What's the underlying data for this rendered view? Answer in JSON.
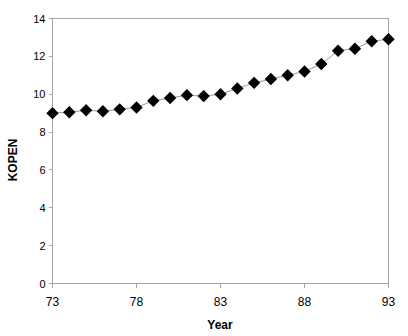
{
  "chart_data": {
    "type": "line",
    "title": "",
    "xlabel": "Year",
    "ylabel": "KOPEN",
    "x": [
      73,
      74,
      75,
      76,
      77,
      78,
      79,
      80,
      81,
      82,
      83,
      84,
      85,
      86,
      87,
      88,
      89,
      90,
      91,
      92,
      93
    ],
    "values": [
      9.0,
      9.05,
      9.15,
      9.1,
      9.2,
      9.3,
      9.65,
      9.8,
      9.95,
      9.9,
      10.0,
      10.3,
      10.6,
      10.8,
      11.0,
      11.2,
      11.6,
      12.3,
      12.4,
      12.8,
      12.9
    ],
    "series": [
      {
        "name": "KOPEN",
        "values": [
          9.0,
          9.05,
          9.15,
          9.1,
          9.2,
          9.3,
          9.65,
          9.8,
          9.95,
          9.9,
          10.0,
          10.3,
          10.6,
          10.8,
          11.0,
          11.2,
          11.6,
          12.3,
          12.4,
          12.8,
          12.9
        ]
      }
    ],
    "xlim": [
      73,
      93
    ],
    "ylim": [
      0,
      14
    ],
    "ytick_values": [
      0,
      2,
      4,
      6,
      8,
      10,
      12,
      14
    ],
    "ytick_labels": [
      "0",
      "2",
      "4",
      "6",
      "8",
      "10",
      "12",
      "14"
    ],
    "xtick_values": [
      73,
      78,
      83,
      88,
      93
    ],
    "xtick_labels": [
      "73",
      "78",
      "83",
      "88",
      "93"
    ],
    "grid": false,
    "legend": false,
    "marker": "diamond",
    "marker_color": "#000000",
    "line_color": "#9a9a9a",
    "axis_color": "#a6a6a6",
    "background": "#ffffff"
  }
}
